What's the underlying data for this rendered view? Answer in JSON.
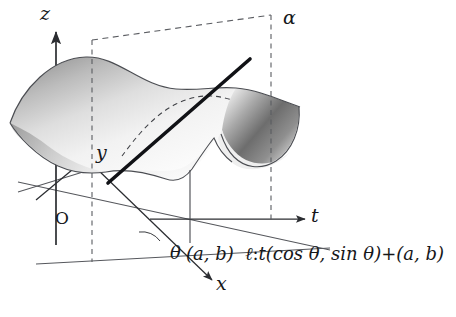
{
  "figure": {
    "kind": "3d-surface-diagram",
    "labels": {
      "z_axis": "z",
      "y_axis": "y",
      "x_axis": "x",
      "t_axis": "t",
      "origin": "O",
      "plane": "α",
      "angle": "θ",
      "point": "(a, b)",
      "line_formula_name": "ℓ",
      "line_formula_colon": ":",
      "line_formula_body": "t(cos θ, sin θ)+(a, b)"
    },
    "colors": {
      "ink": "#16171a",
      "axis": "#4a4c52",
      "surface_light": "#fbfbfb",
      "surface_mid": "#c9c9c9",
      "surface_dark": "#6f6f6f",
      "dashed": "#5a5c61",
      "thick_line": "#111216"
    },
    "geometry": {
      "z_axis_top": 30,
      "z_axis_bottom": 245,
      "t_axis_y": 219,
      "plane_left_x": 92,
      "plane_right_x": 270,
      "vertical_line_x": 190
    }
  }
}
